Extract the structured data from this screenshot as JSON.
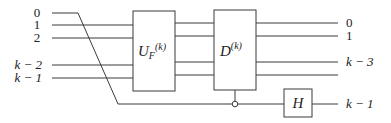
{
  "diagram": {
    "type": "quantum-circuit",
    "input_labels": [
      {
        "text": "0",
        "y": 17
      },
      {
        "text": "1",
        "y": 29
      },
      {
        "text": "2",
        "y": 42
      },
      {
        "text": "k − 2",
        "y": 69
      },
      {
        "text": "k − 1",
        "y": 82
      }
    ],
    "output_labels": [
      {
        "text": "0",
        "y": 27
      },
      {
        "text": "1",
        "y": 40
      },
      {
        "text": "k − 3",
        "y": 66
      },
      {
        "text": "k − 1",
        "y": 107
      }
    ],
    "gates": {
      "uf": {
        "base": "U",
        "sub": "F",
        "sup": "(k)"
      },
      "d": {
        "base": "D",
        "sup": "(k)"
      },
      "h": {
        "label": "H"
      }
    },
    "control": {
      "type": "open-circle",
      "on_wire": "0 (rerouted to bottom)"
    },
    "colors": {
      "line": "#3a3a3a",
      "text": "#222222",
      "background": "#ffffff"
    }
  }
}
